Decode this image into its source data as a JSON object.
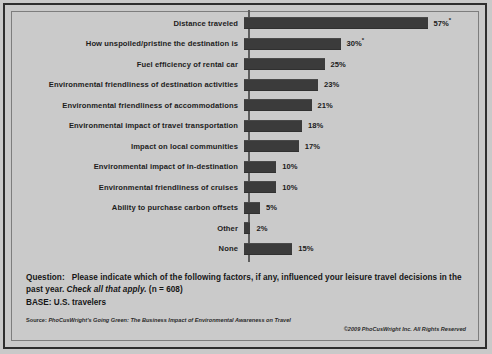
{
  "chart_data": {
    "type": "bar",
    "orientation": "horizontal",
    "title": "",
    "xlabel": "",
    "ylabel": "",
    "xlim": [
      0,
      60
    ],
    "grid": false,
    "legend": null,
    "categories": [
      "Distance traveled",
      "How unspoiled/pristine the destination is",
      "Fuel efficiency of rental car",
      "Environmental friendliness of destination activities",
      "Environmental friendliness of accommodations",
      "Environmental impact of travel transportation",
      "Impact on local communities",
      "Environmental impact of in-destination",
      "Environmental friendliness of cruises",
      "Ability to purchase carbon offsets",
      "Other",
      "None"
    ],
    "values": [
      57,
      30,
      25,
      23,
      21,
      18,
      17,
      10,
      10,
      5,
      2,
      15
    ],
    "value_labels": [
      "57%",
      "30%",
      "25%",
      "23%",
      "21%",
      "18%",
      "17%",
      "10%",
      "10%",
      "5%",
      "2%",
      "15%"
    ],
    "footnote_markers": [
      "*",
      "*",
      "",
      "",
      "",
      "",
      "",
      "",
      "",
      "",
      "",
      ""
    ],
    "bar_color": "#3b3b3b",
    "background_color": "#c9c9c9"
  },
  "footer": {
    "question_label": "Question:",
    "question_text": "Please indicate which of the following factors, if any, influenced your leisure travel decisions in the past year.",
    "question_italic": "Check all that apply.",
    "question_n": "(n = 608)",
    "base": "BASE: U.S. travelers",
    "source_label": "Source:",
    "source_text": "PhoCusWright's Going Green: The Business Impact of Environmental Awareness on Travel",
    "copyright": "©2009 PhoCusWright Inc. All Rights Reserved"
  }
}
